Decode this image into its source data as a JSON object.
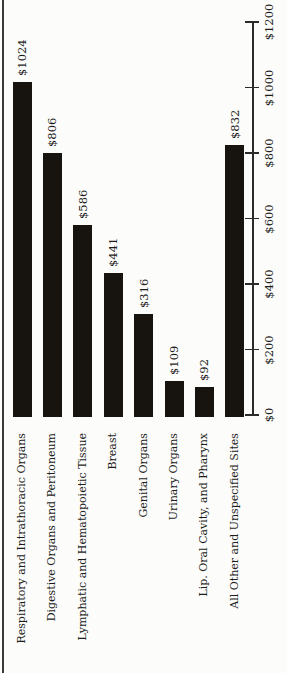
{
  "chart_data": {
    "type": "bar",
    "title": "",
    "xlabel": "",
    "ylabel": "",
    "orientation": "vertical bars, all text rotated 90 degrees counterclockwise (scanned rotated page)",
    "legend": false,
    "grid": false,
    "categories": [
      "Respiratory and Intrathoracic Organs",
      "Digestive Organs and Peritoneum",
      "Lymphatic and Hematopoietic Tissue",
      "Breast",
      "Genital Organs",
      "Urinary Organs",
      "Lip. Oral Cavity, and Pharynx",
      "All Other and Unspecified Sites"
    ],
    "values": [
      1024,
      806,
      586,
      441,
      316,
      109,
      92,
      832
    ],
    "bar_value_labels": [
      "$1024",
      "$806",
      "$586",
      "$441",
      "$316",
      "$109",
      "$92",
      "$832"
    ],
    "ylim": [
      0,
      1200
    ],
    "axis_ticks": {
      "values": [
        0,
        200,
        400,
        600,
        800,
        1000,
        1200
      ],
      "labels": [
        "$0",
        "$200",
        "$400",
        "$600",
        "$800",
        "$1000",
        "$1200"
      ],
      "position": "right side, vertical, $0 at bottom"
    },
    "colors": {
      "bar": "#17130f",
      "axis": "#2b2b2b",
      "text": "#1c1c1c",
      "background": "#fcfcfa",
      "page_edge": "#3a3a3a"
    }
  }
}
